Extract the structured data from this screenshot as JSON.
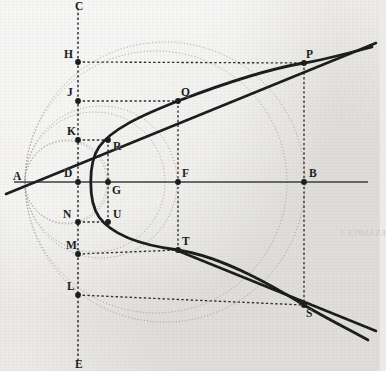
{
  "figure": {
    "background_color": "#ecebe9",
    "ink_color": "#1a1a1a",
    "faint_color": "#8d8b87",
    "width": 380,
    "height": 371
  },
  "axes": {
    "horizontal": {
      "name": "AB",
      "y": 182,
      "x1": 14,
      "x2": 368
    },
    "vertical": {
      "name": "CE",
      "x": 78,
      "y1": 8,
      "y2": 360
    }
  },
  "points": [
    {
      "id": "A",
      "x": 25,
      "y": 182,
      "label": "A",
      "label_dx": -12,
      "label_dy": -11,
      "dot": false
    },
    {
      "id": "B",
      "x": 304,
      "y": 182,
      "label": "B",
      "label_dx": 5,
      "label_dy": -14,
      "dot": true
    },
    {
      "id": "C",
      "x": 78,
      "y": 12,
      "label": "C",
      "label_dx": -3,
      "label_dy": -11,
      "dot": false
    },
    {
      "id": "E",
      "x": 78,
      "y": 356,
      "label": "E",
      "label_dx": -3,
      "label_dy": 3,
      "dot": false
    },
    {
      "id": "D",
      "x": 78,
      "y": 182,
      "label": "D",
      "label_dx": -14,
      "label_dy": -14,
      "dot": true
    },
    {
      "id": "G",
      "x": 108,
      "y": 182,
      "label": "G",
      "label_dx": 4,
      "label_dy": 3,
      "dot": true
    },
    {
      "id": "F",
      "x": 178,
      "y": 182,
      "label": "F",
      "label_dx": 4,
      "label_dy": -14,
      "dot": true
    },
    {
      "id": "H",
      "x": 78,
      "y": 62,
      "label": "H",
      "label_dx": -14,
      "label_dy": -13,
      "dot": true
    },
    {
      "id": "J",
      "x": 78,
      "y": 101,
      "label": "J",
      "label_dx": -11,
      "label_dy": -14,
      "dot": true
    },
    {
      "id": "K",
      "x": 78,
      "y": 140,
      "label": "K",
      "label_dx": -11,
      "label_dy": -14,
      "dot": true
    },
    {
      "id": "N",
      "x": 78,
      "y": 222,
      "label": "N",
      "label_dx": -15,
      "label_dy": -13,
      "dot": true
    },
    {
      "id": "M",
      "x": 78,
      "y": 254,
      "label": "M",
      "label_dx": -12,
      "label_dy": -14,
      "dot": true
    },
    {
      "id": "L",
      "x": 78,
      "y": 295,
      "label": "L",
      "label_dx": -11,
      "label_dy": -14,
      "dot": true
    },
    {
      "id": "R",
      "x": 108,
      "y": 140,
      "label": "R",
      "label_dx": 5,
      "label_dy": 1,
      "dot": true
    },
    {
      "id": "U",
      "x": 108,
      "y": 222,
      "label": "U",
      "label_dx": 5,
      "label_dy": -13,
      "dot": true
    },
    {
      "id": "Q",
      "x": 178,
      "y": 101,
      "label": "Q",
      "label_dx": 3,
      "label_dy": -14,
      "dot": true
    },
    {
      "id": "T",
      "x": 178,
      "y": 250,
      "label": "T",
      "label_dx": 4,
      "label_dy": -14,
      "dot": true
    },
    {
      "id": "P",
      "x": 304,
      "y": 63,
      "label": "P",
      "label_dx": 2,
      "label_dy": -14,
      "dot": true
    },
    {
      "id": "S",
      "x": 304,
      "y": 305,
      "label": "S",
      "label_dx": 2,
      "label_dy": 3,
      "dot": true
    }
  ],
  "circles": [
    {
      "name": "circle-through-H-P",
      "cx": 156,
      "cy": 182,
      "r": 131
    },
    {
      "name": "circle-through-J-Q",
      "cx": 101,
      "cy": 182,
      "r": 76
    },
    {
      "name": "circle-through-K-R",
      "cx": 66,
      "cy": 182,
      "r": 41
    },
    {
      "name": "circle-through-L-S",
      "cx": 165,
      "cy": 182,
      "r": 140
    },
    {
      "name": "circle-through-M-T",
      "cx": 95,
      "cy": 182,
      "r": 70
    },
    {
      "name": "circle-through-N-U",
      "cx": 67,
      "cy": 182,
      "r": 42
    }
  ],
  "dashed_connectors": [
    {
      "name": "H-to-P",
      "x1": 78,
      "y1": 62,
      "x2": 304,
      "y2": 63
    },
    {
      "name": "J-to-Q",
      "x1": 78,
      "y1": 101,
      "x2": 178,
      "y2": 101
    },
    {
      "name": "K-to-R",
      "x1": 78,
      "y1": 140,
      "x2": 108,
      "y2": 140
    },
    {
      "name": "N-to-U",
      "x1": 78,
      "y1": 222,
      "x2": 108,
      "y2": 222
    },
    {
      "name": "M-to-T",
      "x1": 78,
      "y1": 254,
      "x2": 178,
      "y2": 250
    },
    {
      "name": "L-to-S",
      "x1": 78,
      "y1": 295,
      "x2": 304,
      "y2": 305
    },
    {
      "name": "P-vertical",
      "x1": 304,
      "y1": 63,
      "x2": 304,
      "y2": 182
    },
    {
      "name": "S-vertical",
      "x1": 304,
      "y1": 182,
      "x2": 304,
      "y2": 305
    },
    {
      "name": "Q-vertical",
      "x1": 178,
      "y1": 101,
      "x2": 178,
      "y2": 182
    },
    {
      "name": "T-vertical",
      "x1": 178,
      "y1": 182,
      "x2": 178,
      "y2": 250
    },
    {
      "name": "R-vertical",
      "x1": 108,
      "y1": 140,
      "x2": 108,
      "y2": 182
    },
    {
      "name": "U-vertical",
      "x1": 108,
      "y1": 182,
      "x2": 108,
      "y2": 222
    }
  ],
  "parabola": {
    "name": "parabola-curve",
    "vertex_x": 78,
    "vertex_y": 182,
    "path": "M 372 47 C 330 58 312 62 304 63 C 262 70 212 88 178 101 C 140 116 112 129 99 147 C 88 163 88 201 99 217 C 112 235 140 245 178 250 C 224 257 276 288 304 305 C 324 317 348 329 368 340"
  },
  "secant_line": {
    "name": "line-P-S",
    "x1": 362,
    "y1": 44,
    "x2": 362,
    "y2": 44
  },
  "tangent_lines": [
    {
      "name": "tangent-upper-through-P",
      "x1": 6,
      "y1": 194,
      "x2": 376,
      "y2": 43
    },
    {
      "name": "tangent-lower-through-S",
      "x1": 176,
      "y1": 250,
      "x2": 376,
      "y2": 331
    }
  ],
  "ghost_text": [
    {
      "text": "EXAMPLE 1",
      "x": 340,
      "y": 230,
      "size": 8
    }
  ]
}
